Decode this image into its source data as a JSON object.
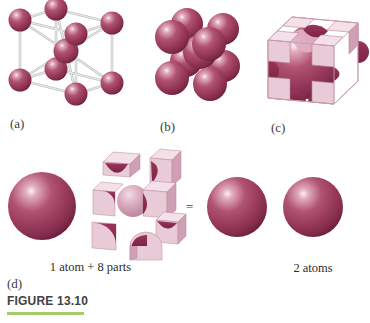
{
  "panel_labels": {
    "a": "(a)",
    "b": "(b)",
    "c": "(c)",
    "d": "(d)"
  },
  "equation": {
    "left_caption": "1 atom + 8 parts",
    "equals_sign": "=",
    "right_caption": "2 atoms"
  },
  "figure_caption": {
    "text": "FIGURE 13.10"
  },
  "colors": {
    "atom_body": "#9b3a5c",
    "atom_dark_rim": "#6a1c38",
    "atom_highlight": "#faeef2",
    "cut_surface_dark": "#8c2e4f",
    "cell_face_light_pink": "#f3e0e8",
    "cell_face_front_pink": "#e8cbd6",
    "cell_face_side_pink": "#cfa0b5",
    "stick_gray": "#c8cbcb",
    "caption_underline_green": "#a5cb6d",
    "label_text": "#3b3b3b",
    "background": "#ffffff"
  }
}
